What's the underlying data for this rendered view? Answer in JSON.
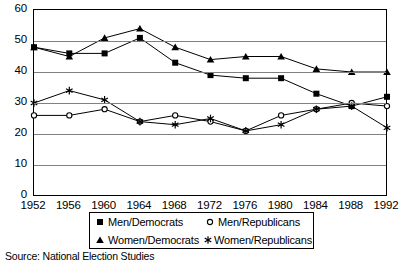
{
  "chart_data": {
    "type": "line",
    "title": "",
    "xlabel": "",
    "ylabel": "",
    "ylim": [
      0,
      60
    ],
    "ytick_step": 10,
    "yticks": [
      60,
      50,
      40,
      30,
      20,
      10,
      0
    ],
    "grid": true,
    "legend_position": "bottom",
    "categories": [
      "1952",
      "1956",
      "1960",
      "1964",
      "1968",
      "1972",
      "1976",
      "1980",
      "1984",
      "1988",
      "1992"
    ],
    "series": [
      {
        "name": "Men/Democrats",
        "marker": "square",
        "values": [
          48,
          46,
          46,
          51,
          43,
          39,
          38,
          38,
          33,
          29,
          32
        ]
      },
      {
        "name": "Men/Republicans",
        "marker": "circle",
        "values": [
          26,
          26,
          28,
          24,
          26,
          24,
          21,
          26,
          28,
          30,
          29
        ]
      },
      {
        "name": "Women/Democrats",
        "marker": "triangle",
        "values": [
          48,
          45,
          51,
          54,
          48,
          44,
          45,
          45,
          41,
          40,
          40
        ]
      },
      {
        "name": "Women/Republicans",
        "marker": "star",
        "values": [
          30,
          34,
          31,
          24,
          23,
          25,
          21,
          23,
          28,
          29,
          22
        ]
      }
    ],
    "colors": {
      "line": "#000000",
      "grid": "#808080",
      "axis": "#000000",
      "background": "#ffffff"
    }
  },
  "source": {
    "label": "Source: National Election Studies"
  },
  "legend": {
    "items": [
      {
        "label": "Men/Democrats",
        "marker": "square"
      },
      {
        "label": "Men/Republicans",
        "marker": "circle"
      },
      {
        "label": "Women/Democrats",
        "marker": "triangle"
      },
      {
        "label": "Women/Republicans",
        "marker": "star"
      }
    ]
  }
}
